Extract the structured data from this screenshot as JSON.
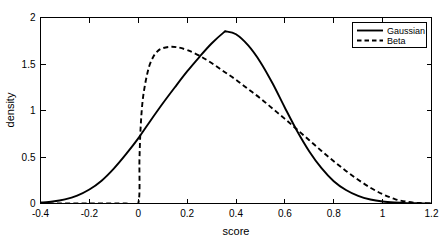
{
  "chart_data": {
    "type": "line",
    "title": "",
    "xlabel": "score",
    "ylabel": "density",
    "xlim": [
      -0.4,
      1.2
    ],
    "ylim": [
      0,
      2
    ],
    "xticks": [
      -0.4,
      -0.2,
      0,
      0.2,
      0.4,
      0.6,
      0.8,
      1,
      1.2
    ],
    "xticklabels": [
      "-0.4",
      "-0.2",
      "0",
      "0.2",
      "0.4",
      "0.6",
      "0.8",
      "1",
      "1.2"
    ],
    "yticks": [
      0,
      0.5,
      1,
      1.5,
      2
    ],
    "yticklabels": [
      "0",
      "0.5",
      "1",
      "1.5",
      "2"
    ],
    "grid": false,
    "legend_position": "top-right",
    "legend_entries": [
      "Gaussian",
      "Beta"
    ],
    "series": [
      {
        "name": "Gaussian",
        "style": "solid",
        "color": "#000000",
        "x": [
          -0.4,
          -0.35,
          -0.3,
          -0.25,
          -0.2,
          -0.15,
          -0.1,
          -0.05,
          0.0,
          0.05,
          0.1,
          0.15,
          0.2,
          0.25,
          0.3,
          0.35,
          0.36,
          0.4,
          0.45,
          0.5,
          0.55,
          0.6,
          0.65,
          0.7,
          0.75,
          0.8,
          0.85,
          0.9,
          0.95,
          1.0,
          1.05,
          1.1,
          1.15,
          1.2
        ],
        "y": [
          0.01,
          0.022,
          0.045,
          0.085,
          0.15,
          0.245,
          0.375,
          0.53,
          0.7,
          0.89,
          1.075,
          1.25,
          1.42,
          1.575,
          1.72,
          1.84,
          1.85,
          1.82,
          1.7,
          1.52,
          1.29,
          1.03,
          0.78,
          0.56,
          0.38,
          0.24,
          0.145,
          0.082,
          0.043,
          0.021,
          0.01,
          0.004,
          0.002,
          0.001
        ]
      },
      {
        "name": "Beta",
        "style": "dashed",
        "color": "#000000",
        "x": [
          -0.4,
          -0.2,
          -0.05,
          0.0,
          0.005,
          0.01,
          0.02,
          0.04,
          0.06,
          0.08,
          0.1,
          0.13,
          0.16,
          0.2,
          0.25,
          0.3,
          0.35,
          0.4,
          0.45,
          0.5,
          0.55,
          0.6,
          0.65,
          0.7,
          0.75,
          0.8,
          0.85,
          0.9,
          0.95,
          1.0,
          1.05,
          1.1,
          1.15,
          1.2
        ],
        "y": [
          0.0,
          0.0,
          0.0,
          0.0,
          0.48,
          0.83,
          1.15,
          1.43,
          1.57,
          1.64,
          1.67,
          1.685,
          1.68,
          1.65,
          1.59,
          1.51,
          1.42,
          1.33,
          1.23,
          1.13,
          1.02,
          0.91,
          0.795,
          0.68,
          0.565,
          0.455,
          0.35,
          0.255,
          0.17,
          0.1,
          0.048,
          0.018,
          0.005,
          0.001
        ]
      }
    ],
    "annotations": {
      "gaussian_peak": {
        "x": 0.36,
        "y": 1.85
      },
      "beta_peak": {
        "x": 0.14,
        "y": 1.685
      },
      "beta_left_cutoff": {
        "x": 0.0,
        "note": "vertical drop to zero at x=0"
      },
      "crossing_left": {
        "x": 0.25,
        "y": 1.6
      },
      "crossing_right": {
        "x": 0.63,
        "y": 0.85
      }
    }
  }
}
